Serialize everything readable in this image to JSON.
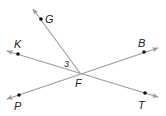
{
  "diagram": {
    "type": "geometry-lines",
    "intersection": {
      "label": "F",
      "x": 80,
      "y": 73
    },
    "angle_label": {
      "text": "3",
      "x": 68,
      "y": 66
    },
    "colors": {
      "line": "#9a9a9a",
      "point": "#111111",
      "text": "#222222"
    },
    "lines": [
      {
        "name": "line-GF",
        "from": {
          "x": 33,
          "y": 9
        },
        "to": {
          "x": 80,
          "y": 73
        },
        "arrow_start": true,
        "arrow_end": false
      },
      {
        "name": "line-KT",
        "from": {
          "x": 7,
          "y": 51
        },
        "to": {
          "x": 158,
          "y": 97
        },
        "arrow_start": true,
        "arrow_end": true
      },
      {
        "name": "line-PB",
        "from": {
          "x": 7,
          "y": 99
        },
        "to": {
          "x": 158,
          "y": 48
        },
        "arrow_start": true,
        "arrow_end": true
      }
    ],
    "points": [
      {
        "label": "G",
        "x": 41,
        "y": 19,
        "lx": 45,
        "ly": 23
      },
      {
        "label": "K",
        "x": 18,
        "y": 54,
        "lx": 14,
        "ly": 48
      },
      {
        "label": "B",
        "x": 144,
        "y": 52,
        "lx": 138,
        "ly": 47
      },
      {
        "label": "P",
        "x": 19,
        "y": 95,
        "lx": 14,
        "ly": 110
      },
      {
        "label": "T",
        "x": 145,
        "y": 93,
        "lx": 138,
        "ly": 109
      }
    ],
    "labels": {
      "G": "G",
      "K": "K",
      "B": "B",
      "P": "P",
      "T": "T",
      "F": "F",
      "angle": "3"
    }
  }
}
